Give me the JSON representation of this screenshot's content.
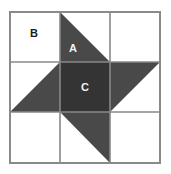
{
  "figure": {
    "width": 171,
    "height": 174,
    "background_color": "#ffffff"
  },
  "geometry": {
    "grid_left": 10,
    "grid_top": 12,
    "grid_right": 160,
    "grid_bottom": 163,
    "columns": 3,
    "rows": 3,
    "x_lines": [
      10,
      60,
      110,
      160
    ],
    "y_lines": [
      12,
      62,
      112,
      163
    ]
  },
  "colors": {
    "background": "#ffffff",
    "patch_light": "#ffffff",
    "patch_blade": "#494949",
    "patch_center": "#343434",
    "grid_line": "#888888",
    "frame_line": "#8a8a8a",
    "label_on_light": "#1a1a1a",
    "label_on_dark": "#f2f2f2"
  },
  "labels": {
    "corner": "B",
    "blade": "A",
    "center": "C"
  },
  "patches": [
    {
      "id": "corner-top-left",
      "kind": "square",
      "fill": "#ffffff",
      "points": "10,12 60,12 60,62 10,62",
      "label": "B",
      "label_x": 34,
      "label_y": 34,
      "label_style": "dark"
    },
    {
      "id": "blade-top",
      "kind": "triangle",
      "fill": "#494949",
      "points": "60,12 110,62 60,62",
      "label": "A",
      "label_x": 73,
      "label_y": 49,
      "label_style": "light"
    },
    {
      "id": "corner-top-right",
      "kind": "square",
      "fill": "#ffffff",
      "points": "110,12 160,12 160,62 110,62",
      "label": "",
      "label_x": 135,
      "label_y": 37,
      "label_style": "dark"
    },
    {
      "id": "blade-left",
      "kind": "triangle",
      "fill": "#494949",
      "points": "60,62 60,112 10,112",
      "label": "",
      "label_x": 38,
      "label_y": 96,
      "label_style": "light"
    },
    {
      "id": "center-square",
      "kind": "square",
      "fill": "#343434",
      "points": "60,62 110,62 110,112 60,112",
      "label": "C",
      "label_x": 85,
      "label_y": 88,
      "label_style": "light"
    },
    {
      "id": "blade-right",
      "kind": "triangle",
      "fill": "#494949",
      "points": "110,62 160,62 110,112",
      "label": "",
      "label_x": 130,
      "label_y": 78,
      "label_style": "light"
    },
    {
      "id": "corner-bottom-left",
      "kind": "square",
      "fill": "#ffffff",
      "points": "10,112 60,112 60,163 10,163",
      "label": "",
      "label_x": 35,
      "label_y": 138,
      "label_style": "dark"
    },
    {
      "id": "blade-bottom",
      "kind": "triangle",
      "fill": "#494949",
      "points": "60,112 110,112 110,163",
      "label": "",
      "label_x": 95,
      "label_y": 134,
      "label_style": "light"
    },
    {
      "id": "corner-bottom-right",
      "kind": "square",
      "fill": "#ffffff",
      "points": "110,112 160,112 160,163 110,163",
      "label": "",
      "label_x": 135,
      "label_y": 138,
      "label_style": "dark"
    }
  ]
}
